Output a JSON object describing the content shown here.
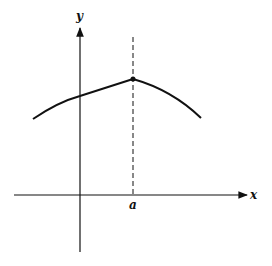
{
  "diagram": {
    "x_axis_label": "x",
    "y_axis_label": "y",
    "point_label": "a",
    "colors": {
      "ink": "#111111",
      "background": "#ffffff"
    }
  }
}
